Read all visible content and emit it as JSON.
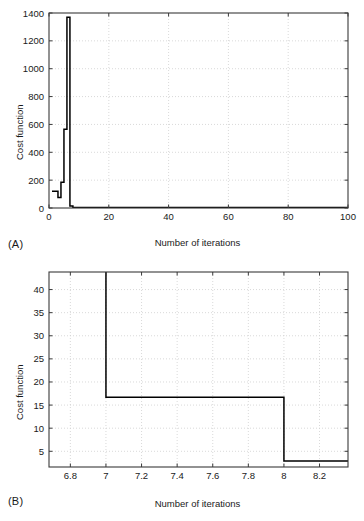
{
  "figure": {
    "background": "#ffffff",
    "line_color": "#000000",
    "grid_color": "#cfcfcf",
    "axis_color": "#3a3a3a"
  },
  "panels": [
    {
      "id": "a",
      "panel_label": "(A)",
      "chart_data": {
        "type": "line",
        "title": "",
        "subtitle": "",
        "xlabel": "Number of iterations",
        "ylabel": "Cost function",
        "xlim": [
          0,
          100
        ],
        "ylim": [
          0,
          1400
        ],
        "xticks": [
          0,
          20,
          40,
          60,
          80,
          100
        ],
        "xtick_labels": [
          "0",
          "20",
          "40",
          "60",
          "80",
          "100"
        ],
        "yticks": [
          0,
          200,
          400,
          600,
          800,
          1000,
          1200,
          1400
        ],
        "ytick_labels": [
          "0",
          "200",
          "400",
          "600",
          "800",
          "1000",
          "1200",
          "1400"
        ],
        "grid": true,
        "grid_style": "dotted",
        "legend": null,
        "legend_position": "none",
        "series": [
          {
            "name": "cost",
            "style": "step-post",
            "x": [
              1,
              2,
              3,
              4,
              5,
              6,
              7,
              8,
              9,
              10,
              20,
              40,
              60,
              80,
              100
            ],
            "y": [
              120,
              120,
              75,
              185,
              565,
              1370,
              15,
              4,
              4,
              4,
              4,
              4,
              4,
              4,
              4
            ]
          }
        ]
      }
    },
    {
      "id": "b",
      "panel_label": "(B)",
      "chart_data": {
        "type": "line",
        "title": "",
        "subtitle": "",
        "xlabel": "Number of iterations",
        "ylabel": "Cost function",
        "xlim": [
          6.68,
          8.36
        ],
        "ylim": [
          1.6,
          43.8
        ],
        "xticks": [
          6.8,
          7,
          7.2,
          7.4,
          7.6,
          7.8,
          8,
          8.2
        ],
        "xtick_labels": [
          "6.8",
          "7",
          "7.2",
          "7.4",
          "7.6",
          "7.8",
          "8",
          "8.2"
        ],
        "yticks": [
          5,
          10,
          15,
          20,
          25,
          30,
          35,
          40
        ],
        "ytick_labels": [
          "5",
          "10",
          "15",
          "20",
          "25",
          "30",
          "35",
          "40"
        ],
        "grid": true,
        "grid_style": "dotted",
        "legend": null,
        "legend_position": "none",
        "series": [
          {
            "name": "cost",
            "style": "step-post",
            "x": [
              7,
              8,
              8.36
            ],
            "y": [
              16.7,
              2.9,
              2.9
            ],
            "enters_from_top_at_x": 7,
            "top_value": 43.8
          }
        ]
      }
    }
  ]
}
